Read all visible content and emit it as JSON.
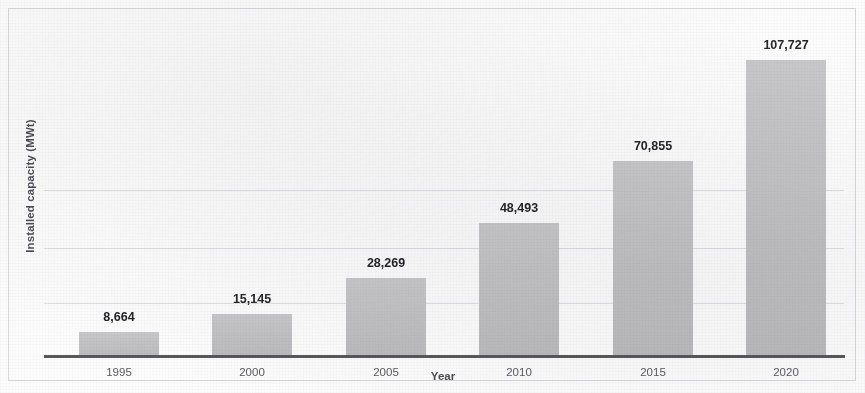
{
  "chart_data": {
    "type": "bar",
    "title": "",
    "subtitle": "",
    "xlabel": "Year",
    "ylabel": "Installed capacity (MWt)",
    "categories": [
      "1995",
      "2000",
      "2005",
      "2010",
      "2015",
      "2020"
    ],
    "values": [
      8664,
      15145,
      28269,
      48493,
      70855,
      107727
    ],
    "value_labels": [
      "8,664",
      "15,145",
      "28,269",
      "48,493",
      "70,855",
      "107,727"
    ],
    "ylim": [
      0,
      107727
    ],
    "y_tick_labels": [],
    "grid": "faint horizontal gridlines only",
    "legend": "none",
    "series": [
      {
        "name": "Installed capacity (MWt)",
        "values": [
          8664,
          15145,
          28269,
          48493,
          70855,
          107727
        ]
      }
    ],
    "colors": {
      "bar_fill": "#c2c2c4",
      "axis_line": "#58585c",
      "value_label": "#25252a",
      "tick_label": "#5b5b60",
      "axis_title": "#4e4e52",
      "gridline": "#cdcdd2",
      "background": "#fdfdfd"
    }
  }
}
